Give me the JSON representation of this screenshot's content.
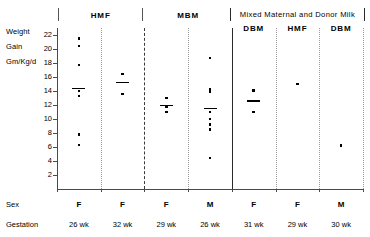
{
  "axis": {
    "caption_lines": [
      "Weight",
      "Gain",
      "Gm/Kg/d"
    ],
    "ticks": [
      22,
      20,
      18,
      16,
      14,
      12,
      10,
      8,
      6,
      4,
      2
    ]
  },
  "headers": {
    "hmf": "HMF",
    "mbm": "MBM",
    "mixed": "Mixed Maternal and Donor Milk",
    "mixed_sub": [
      "DBM",
      "HMF",
      "DBM"
    ]
  },
  "rows": {
    "sex_label": "Sex",
    "gestation_label": "Gestation"
  },
  "chart_data": {
    "type": "scatter",
    "title": "",
    "xlabel": "",
    "ylabel": "Weight Gain Gm/Kg/d",
    "ylim": [
      0,
      23
    ],
    "yticks": [
      2,
      4,
      6,
      8,
      10,
      12,
      14,
      16,
      18,
      20,
      22
    ],
    "grid": false,
    "legend": "none",
    "groups": [
      {
        "group": "HMF",
        "subgroup": "",
        "sex": "F",
        "gestation": "26 wk",
        "values": [
          21.5,
          20.4,
          17.7,
          14.0,
          13.3,
          7.8,
          6.3
        ],
        "mean": 14.4
      },
      {
        "group": "HMF",
        "subgroup": "",
        "sex": "F",
        "gestation": "32 wk",
        "values": [
          16.4,
          13.6
        ],
        "mean": 15.2
      },
      {
        "group": "MBM",
        "subgroup": "",
        "sex": "F",
        "gestation": "29 wk",
        "values": [
          13.0,
          11.8,
          11.0
        ],
        "mean": 11.9
      },
      {
        "group": "MBM",
        "subgroup": "",
        "sex": "M",
        "gestation": "26 wk",
        "values": [
          18.7,
          14.2,
          13.9,
          11.0,
          10.0,
          9.2,
          8.5,
          4.4
        ],
        "mean": 11.5
      },
      {
        "group": "Mixed Maternal and Donor Milk",
        "subgroup": "DBM",
        "sex": "F",
        "gestation": "31 wk",
        "values": [
          14.1,
          11.0
        ],
        "mean": 12.6
      },
      {
        "group": "Mixed Maternal and Donor Milk",
        "subgroup": "HMF",
        "sex": "F",
        "gestation": "29 wk",
        "values": [
          15.0
        ],
        "mean": null
      },
      {
        "group": "Mixed Maternal and Donor Milk",
        "subgroup": "DBM",
        "sex": "M",
        "gestation": "30 wk",
        "values": [
          6.2
        ],
        "mean": null
      }
    ]
  }
}
